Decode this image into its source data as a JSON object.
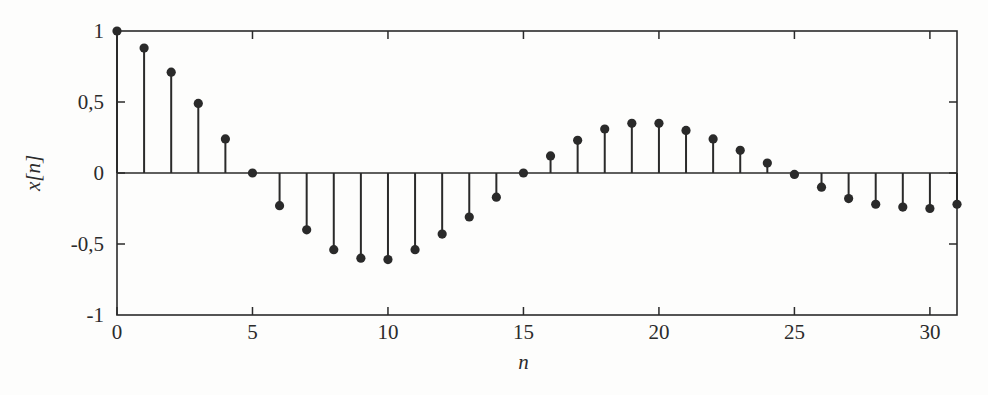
{
  "figure": {
    "background_color": "#fdfdfc",
    "ink_color": "#2a2a2a"
  },
  "chart_data": {
    "type": "scatter",
    "plot_style": "stem",
    "title": "",
    "subtitle": "",
    "xlabel": "n",
    "ylabel": "x[n]",
    "xlim": [
      0,
      31
    ],
    "ylim": [
      -1,
      1
    ],
    "xticks": [
      0,
      5,
      10,
      15,
      20,
      25,
      30
    ],
    "xticklabels": [
      "0",
      "5",
      "10",
      "15",
      "20",
      "25",
      "30"
    ],
    "yticks": [
      -1,
      -0.5,
      0,
      0.5,
      1
    ],
    "yticklabels": [
      "-1",
      "-0,5",
      "0",
      "0,5",
      "1"
    ],
    "decimal_separator": ",",
    "grid": false,
    "legend": null,
    "baseline": 0,
    "marker": "filled-circle",
    "x": [
      0,
      1,
      2,
      3,
      4,
      5,
      6,
      7,
      8,
      9,
      10,
      11,
      12,
      13,
      14,
      15,
      16,
      17,
      18,
      19,
      20,
      21,
      22,
      23,
      24,
      25,
      26,
      27,
      28,
      29,
      30,
      31
    ],
    "values": [
      1.0,
      0.88,
      0.71,
      0.49,
      0.24,
      0.0,
      -0.23,
      -0.4,
      -0.54,
      -0.6,
      -0.61,
      -0.54,
      -0.43,
      -0.31,
      -0.17,
      0.0,
      0.12,
      0.23,
      0.31,
      0.35,
      0.35,
      0.3,
      0.24,
      0.16,
      0.07,
      -0.01,
      -0.1,
      -0.18,
      -0.22,
      -0.24,
      -0.25,
      -0.22
    ],
    "series": [
      {
        "name": "x[n]",
        "values": [
          1.0,
          0.88,
          0.71,
          0.49,
          0.24,
          0.0,
          -0.23,
          -0.4,
          -0.54,
          -0.6,
          -0.61,
          -0.54,
          -0.43,
          -0.31,
          -0.17,
          0.0,
          0.12,
          0.23,
          0.31,
          0.35,
          0.35,
          0.3,
          0.24,
          0.16,
          0.07,
          -0.01,
          -0.1,
          -0.18,
          -0.22,
          -0.24,
          -0.25,
          -0.22
        ]
      }
    ]
  }
}
